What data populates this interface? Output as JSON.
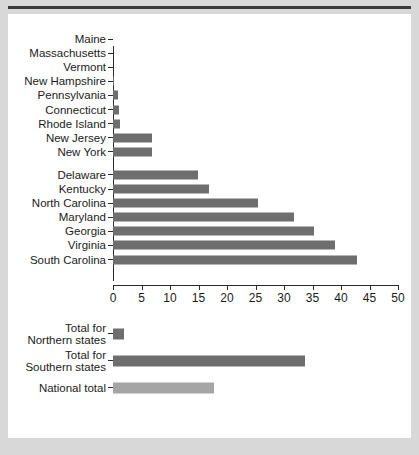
{
  "figure": {
    "background_color": "#d8d8d8",
    "card_color": "#ffffff",
    "bar_color": "#6e6e6e",
    "bar_color_light": "#a5a5a5",
    "axis_color": "#2b2b2b",
    "rule_color": "#3a3a3a"
  },
  "chart_data": {
    "type": "bar",
    "orientation": "horizontal",
    "title": "",
    "xlabel": "Percentage",
    "ylabel": "",
    "xlim": [
      0,
      50
    ],
    "xticks": [
      0,
      5,
      10,
      15,
      20,
      25,
      30,
      35,
      40,
      45,
      50
    ],
    "xticklabels": [
      "0",
      "5",
      "10",
      "15",
      "20",
      "25",
      "30",
      "35",
      "40",
      "45",
      "50"
    ],
    "grid": false,
    "legend": false,
    "panels": [
      {
        "name": "states",
        "xlabel": "",
        "groups": [
          {
            "name": "Northern states",
            "categories": [
              "Maine",
              "Massachusetts",
              "Vermont",
              "New Hampshire",
              "Pennsylvania",
              "Connecticut",
              "Rhode Island",
              "New Jersey",
              "New York"
            ],
            "values": [
              0.0,
              0.0,
              0.0,
              0.1,
              0.9,
              1.1,
              1.2,
              6.8,
              6.8
            ]
          },
          {
            "name": "Southern states",
            "categories": [
              "Delaware",
              "Kentucky",
              "North Carolina",
              "Maryland",
              "Georgia",
              "Virginia",
              "South Carolina"
            ],
            "values": [
              14.9,
              16.9,
              25.5,
              31.8,
              35.2,
              38.9,
              42.8
            ]
          }
        ]
      },
      {
        "name": "totals",
        "xlabel": "Percentage",
        "groups": [
          {
            "name": "Totals",
            "categories": [
              "Total for\nNorthern states",
              "Total for\nSouthern states",
              "National total"
            ],
            "values": [
              1.9,
              33.7,
              17.7
            ],
            "colors": [
              "#6e6e6e",
              "#6e6e6e",
              "#a5a5a5"
            ]
          }
        ]
      }
    ]
  }
}
